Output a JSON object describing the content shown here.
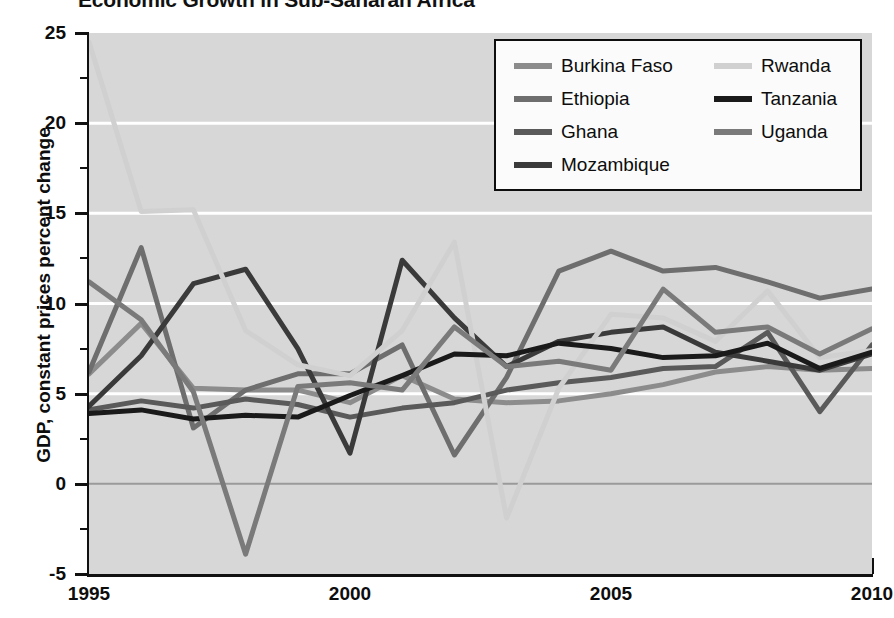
{
  "title": "Economic Growth in Sub-Saharan Africa",
  "legend": {
    "columns": [
      {
        "entries": [
          0,
          1,
          2,
          3
        ]
      },
      {
        "entries": [
          4,
          5,
          6
        ]
      }
    ]
  },
  "chart_data": {
    "type": "line",
    "title": "Economic Growth in Sub-Saharan Africa",
    "xlabel": "",
    "ylabel": "GDP, constant prices percent change",
    "xlim": [
      1995,
      2010
    ],
    "ylim": [
      -5,
      25
    ],
    "ytick_labels": [
      "25",
      "20",
      "15",
      "10",
      "5",
      "0",
      "-5"
    ],
    "yticks": [
      25,
      20,
      15,
      10,
      5,
      0,
      -5
    ],
    "xtick_labels": [
      "1995",
      "2000",
      "2005",
      "2010"
    ],
    "xticks": [
      1995,
      2000,
      2005,
      2010
    ],
    "x_minor_step": 1,
    "grid": "horizontal-white-gridlines-at-5-10-15-20-and-gray-zero-line",
    "legend_position": "top-right-inside",
    "plot_background": "#d7d7d7",
    "x": [
      1995,
      1996,
      1997,
      1998,
      1999,
      2000,
      2001,
      2002,
      2003,
      2004,
      2005,
      2006,
      2007,
      2008,
      2009,
      2010
    ],
    "series": [
      {
        "name": "Burkina Faso",
        "color": "#8c8c8c",
        "values": [
          6.1,
          8.9,
          5.3,
          5.2,
          5.2,
          4.5,
          6.0,
          4.7,
          4.5,
          4.6,
          5.0,
          5.5,
          6.2,
          6.5,
          6.3,
          6.4
        ]
      },
      {
        "name": "Ethiopia",
        "color": "#6e6e6e",
        "values": [
          6.2,
          13.1,
          3.1,
          5.2,
          6.1,
          6.1,
          7.7,
          1.6,
          5.9,
          11.8,
          12.9,
          11.8,
          12.0,
          11.2,
          10.3,
          10.8
        ]
      },
      {
        "name": "Ghana",
        "color": "#5a5a5a",
        "values": [
          4.1,
          4.6,
          4.2,
          4.7,
          4.4,
          3.7,
          4.2,
          4.5,
          5.2,
          5.6,
          5.9,
          6.4,
          6.5,
          8.4,
          4.0,
          7.7
        ]
      },
      {
        "name": "Mozambique",
        "color": "#3a3a3a",
        "values": [
          4.3,
          7.1,
          11.1,
          11.9,
          7.5,
          1.7,
          12.4,
          9.2,
          6.5,
          7.9,
          8.4,
          8.7,
          7.3,
          6.8,
          6.3,
          7.2
        ]
      },
      {
        "name": "Rwanda",
        "color": "#d0d0d0",
        "values": [
          24.5,
          15.1,
          15.2,
          8.5,
          6.6,
          6.0,
          8.5,
          13.4,
          -1.9,
          5.3,
          9.4,
          9.2,
          7.9,
          10.7,
          7.0,
          7.4
        ]
      },
      {
        "name": "Tanzania",
        "color": "#1a1a1a",
        "values": [
          3.9,
          4.1,
          3.6,
          3.8,
          3.7,
          4.9,
          6.0,
          7.2,
          7.1,
          7.8,
          7.5,
          7.0,
          7.1,
          7.8,
          6.4,
          7.3
        ]
      },
      {
        "name": "Uganda",
        "color": "#7a7a7a",
        "values": [
          11.2,
          9.1,
          5.1,
          -3.9,
          5.4,
          5.6,
          5.2,
          8.7,
          6.5,
          6.8,
          6.3,
          10.8,
          8.4,
          8.7,
          7.2,
          8.6
        ]
      }
    ]
  }
}
